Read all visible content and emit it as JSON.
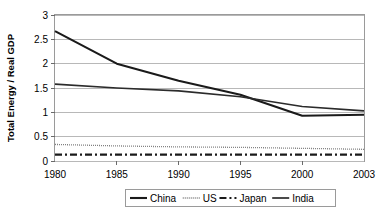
{
  "chart_data": {
    "type": "line",
    "title": "",
    "xlabel": "",
    "ylabel": "Total Energy / Real GDP",
    "x": [
      1980,
      1985,
      1990,
      1995,
      2000,
      2003
    ],
    "xtick_labels": [
      "1980",
      "1985",
      "1990",
      "1995",
      "2000",
      "2003"
    ],
    "ytick_labels": [
      "0",
      "0.5",
      "1",
      "1.5",
      "2",
      "2.5",
      "3"
    ],
    "ytick_values": [
      0,
      0.5,
      1,
      1.5,
      2,
      2.5,
      3
    ],
    "ylim": [
      0,
      3
    ],
    "xlim": [
      1980,
      2003
    ],
    "grid": "horizontal",
    "legend_position": "bottom",
    "series": [
      {
        "name": "China",
        "style": "solid-thick",
        "color": "#1a1a1a",
        "values": [
          2.67,
          2.0,
          1.65,
          1.36,
          0.93,
          0.95
        ]
      },
      {
        "name": "US",
        "style": "dotted-thin",
        "color": "#808080",
        "values": [
          0.34,
          0.31,
          0.29,
          0.28,
          0.26,
          0.24
        ]
      },
      {
        "name": "Japan",
        "style": "dash-dot",
        "color": "#1a1a1a",
        "values": [
          0.13,
          0.13,
          0.13,
          0.13,
          0.13,
          0.13
        ]
      },
      {
        "name": "India",
        "style": "solid",
        "color": "#2b2b2b",
        "values": [
          1.58,
          1.5,
          1.44,
          1.32,
          1.12,
          1.03
        ]
      }
    ]
  },
  "legend": {
    "items": [
      {
        "label": "China",
        "swatch": "solid-thick"
      },
      {
        "label": "US",
        "swatch": "dotted-thin"
      },
      {
        "label": "Japan",
        "swatch": "dash-dot"
      },
      {
        "label": "India",
        "swatch": "solid"
      }
    ]
  }
}
